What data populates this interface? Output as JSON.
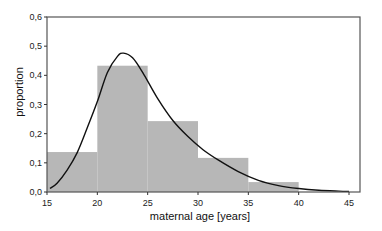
{
  "chart_data": {
    "type": "bar",
    "subtype": "histogram-with-density-curve",
    "title": "",
    "xlabel": "maternal age [years]",
    "ylabel": "proportion",
    "xlim": [
      15,
      45
    ],
    "ylim": [
      0,
      0.6
    ],
    "grid": false,
    "legend": null,
    "x_ticks": [
      15,
      20,
      25,
      30,
      35,
      40,
      45
    ],
    "x_tick_labels": [
      "15",
      "20",
      "25",
      "30",
      "35",
      "40",
      "45"
    ],
    "y_ticks": [
      0,
      0.1,
      0.2,
      0.3,
      0.4,
      0.5,
      0.6
    ],
    "y_tick_labels": [
      "0,0",
      "0,1",
      "0,2",
      "0,3",
      "0,4",
      "0,5",
      "0,6"
    ],
    "categories": [
      "15-20",
      "20-25",
      "25-30",
      "30-35",
      "35-40"
    ],
    "bins": [
      [
        15,
        20
      ],
      [
        20,
        25
      ],
      [
        25,
        30
      ],
      [
        30,
        35
      ],
      [
        35,
        40
      ]
    ],
    "values": [
      0.137,
      0.433,
      0.243,
      0.117,
      0.034
    ],
    "series": [
      {
        "name": "histogram",
        "type": "bar",
        "color": "#b7b7b7",
        "values": [
          0.137,
          0.433,
          0.243,
          0.117,
          0.034
        ]
      },
      {
        "name": "fitted density",
        "type": "line",
        "color": "#111111",
        "x": [
          15.3,
          16,
          17,
          18,
          19,
          20,
          21,
          22,
          22.6,
          23.5,
          24.5,
          26,
          27.5,
          29,
          30.5,
          32,
          34,
          36,
          38,
          40,
          42,
          44,
          45
        ],
        "values": [
          0.012,
          0.03,
          0.075,
          0.135,
          0.22,
          0.31,
          0.41,
          0.465,
          0.476,
          0.46,
          0.41,
          0.32,
          0.245,
          0.19,
          0.145,
          0.11,
          0.07,
          0.04,
          0.022,
          0.012,
          0.006,
          0.003,
          0.002
        ]
      }
    ]
  },
  "colors": {
    "bar_fill": "#b7b7b7",
    "curve": "#111111",
    "frame": "#555555"
  }
}
